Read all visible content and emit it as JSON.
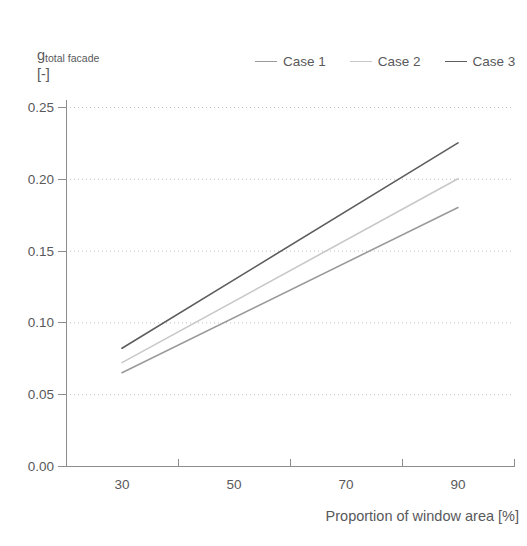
{
  "chart_data": {
    "type": "line",
    "title": "",
    "xlabel": "Proportion of window area [%]",
    "ylabel": "g",
    "ylabel_sub": "total facade",
    "ylabel_unit": "[-]",
    "x": [
      30,
      90
    ],
    "xlim": [
      20,
      100
    ],
    "ylim": [
      0.0,
      0.25
    ],
    "xticks": [
      20,
      40,
      60,
      80,
      100
    ],
    "xtick_labels": [
      "30",
      "50",
      "70",
      "90"
    ],
    "xtick_label_positions": [
      30,
      50,
      70,
      90
    ],
    "yticks": [
      0.0,
      0.05,
      0.1,
      0.15,
      0.2,
      0.25
    ],
    "ytick_labels": [
      "0.00",
      "0.05",
      "0.10",
      "0.15",
      "0.20",
      "0.25"
    ],
    "grid": "horizontal-dotted",
    "legend_position": "top-right",
    "series": [
      {
        "name": "Case 1",
        "color": "#9a9a9c",
        "values": [
          0.065,
          0.18
        ]
      },
      {
        "name": "Case 2",
        "color": "#c8c8ca",
        "values": [
          0.072,
          0.2
        ]
      },
      {
        "name": "Case 3",
        "color": "#5d5d5f",
        "values": [
          0.082,
          0.225
        ]
      }
    ]
  },
  "axis": {
    "y_title_main": "g",
    "y_title_sub": "total facade",
    "y_title_unit": "[-]",
    "x_title": "Proportion of window area [%]",
    "y_labels": [
      "0.25",
      "0.20",
      "0.15",
      "0.10",
      "0.05",
      "0.00"
    ],
    "x_labels": [
      "30",
      "50",
      "70",
      "90"
    ]
  },
  "legend": {
    "items": [
      {
        "label": "Case 1",
        "color": "#9a9a9c"
      },
      {
        "label": "Case 2",
        "color": "#c8c8ca"
      },
      {
        "label": "Case 3",
        "color": "#5d5d5f"
      }
    ]
  }
}
